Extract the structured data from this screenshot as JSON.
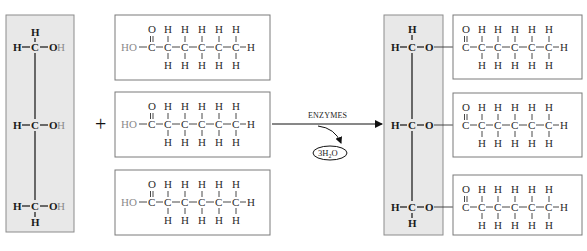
{
  "diagram": {
    "colors": {
      "glycerol_box_fill": "#e8e8e8",
      "glycerol_box_stroke": "#8c8c8c",
      "acid_box_fill": "#ffffff",
      "acid_box_stroke": "#7a7a7a",
      "removed_atom": "#8a8a8a",
      "line": "#222222"
    },
    "reactants": {
      "glycerol": {
        "label": "glycerol",
        "rows": [
          {
            "left": "H",
            "center": "C",
            "right_bold": "O",
            "right_faded": "H"
          },
          {
            "left": "H",
            "center": "C",
            "right_bold": "O",
            "right_faded": "H"
          },
          {
            "left": "H",
            "center": "C",
            "right_bold": "O",
            "right_faded": "H"
          }
        ],
        "top_h": "H",
        "bottom_h": "H"
      },
      "plus_sign": "+",
      "fatty_acids": [
        {
          "head_faded": "H",
          "head": "O",
          "carbonyl_o": "O",
          "carbons": [
            "C",
            "C",
            "C",
            "C",
            "C",
            "C"
          ],
          "top_h": [
            "H",
            "H",
            "H",
            "H",
            "H"
          ],
          "bottom_h": [
            "H",
            "H",
            "H",
            "H",
            "H"
          ],
          "tail_h": "H"
        },
        {
          "head_faded": "H",
          "head": "O",
          "carbonyl_o": "O",
          "carbons": [
            "C",
            "C",
            "C",
            "C",
            "C",
            "C"
          ],
          "top_h": [
            "H",
            "H",
            "H",
            "H",
            "H"
          ],
          "bottom_h": [
            "H",
            "H",
            "H",
            "H",
            "H"
          ],
          "tail_h": "H"
        },
        {
          "head_faded": "H",
          "head": "O",
          "carbonyl_o": "O",
          "carbons": [
            "C",
            "C",
            "C",
            "C",
            "C",
            "C"
          ],
          "top_h": [
            "H",
            "H",
            "H",
            "H",
            "H"
          ],
          "bottom_h": [
            "H",
            "H",
            "H",
            "H",
            "H"
          ],
          "tail_h": "H"
        }
      ]
    },
    "reaction": {
      "arrow_label": "ENZYMES",
      "byproduct": "3H",
      "byproduct_sub": "2",
      "byproduct_tail": "O"
    },
    "product": {
      "glycerol_rows": [
        {
          "left": "H",
          "center": "C",
          "link": "O"
        },
        {
          "left": "H",
          "center": "C",
          "link": "O"
        },
        {
          "left": "H",
          "center": "C",
          "link": "O"
        }
      ],
      "top_h": "H",
      "bottom_h": "H",
      "fatty_acid_chains": 3
    },
    "atoms": {
      "H": "H",
      "C": "C",
      "O": "O",
      "HO": "HO"
    }
  }
}
